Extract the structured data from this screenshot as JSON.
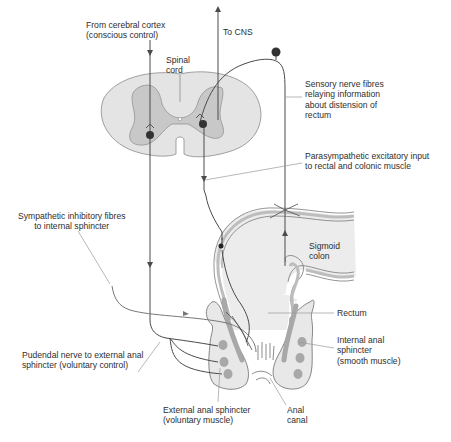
{
  "diagram": {
    "colors": {
      "nerve": "#4a4a4a",
      "cord_white_matter": "#e4e4e4",
      "cord_grey_matter": "#c8c8c8",
      "gut_lumen": "#ececec",
      "gut_wall": "#bdbdbd",
      "sphincter_muscle": "#a8a8a8",
      "neuron_body": "#333333",
      "leader_line": "#9a9a9a"
    },
    "labels": {
      "cerebral_cortex": "From cerebral cortex\n(conscious control)",
      "to_cns": "To CNS",
      "spinal_cord": "Spinal\ncord",
      "sensory_fibres": "Sensory nerve fibres\nrelaying information\nabout distension of\nrectum",
      "parasympathetic": "Parasympathetic excitatory input\nto rectal and colonic muscle",
      "sympathetic": "Sympathetic inhibitory fibres\nto internal sphincter",
      "sigmoid_colon": "Sigmoid\ncolon",
      "rectum": "Rectum",
      "internal_sphincter": "Internal anal\nsphincter\n(smooth muscle)",
      "pudendal_nerve": "Pudendal nerve to external anal\nsphincter (voluntary control)",
      "external_sphincter": "External anal sphincter\n(voluntary muscle)",
      "anal_canal": "Anal\ncanal"
    }
  }
}
